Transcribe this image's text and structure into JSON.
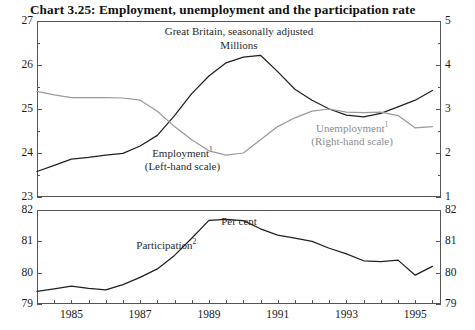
{
  "title": "Chart 3.25: Employment, unemployment and the participation rate",
  "chart_data": [
    {
      "type": "line",
      "title": "Great Britain, seasonally adjusted",
      "subtitle": "Millions",
      "xlabel": "",
      "ylabel": "Millions",
      "y2label": "Millions",
      "xlim": [
        1984.0,
        1995.75
      ],
      "ylim": [
        23,
        27
      ],
      "y2lim": [
        1,
        5
      ],
      "grid": false,
      "legend": "in-plot annotations",
      "yticks": [
        23,
        24,
        25,
        26,
        27
      ],
      "yticklabels": [
        "23",
        "24",
        "25",
        "26",
        "27"
      ],
      "yminorticks": [
        23.5,
        24.5,
        25.5,
        26.5
      ],
      "y2ticks": [
        1,
        2,
        3,
        4,
        5
      ],
      "y2ticklabels": [
        "1",
        "2",
        "3",
        "4",
        "5"
      ],
      "y2minorticks": [
        1.5,
        2.5,
        3.5,
        4.5
      ],
      "xticks": [
        1984.5,
        1985,
        1985.5,
        1986,
        1986.5,
        1987,
        1987.5,
        1988,
        1988.5,
        1989,
        1989.5,
        1990,
        1990.5,
        1991,
        1991.5,
        1992,
        1992.5,
        1993,
        1993.5,
        1994,
        1994.5,
        1995,
        1995.5
      ],
      "xticklabels": [
        "1985",
        "1987",
        "1989",
        "1991",
        "1993",
        "1995"
      ],
      "xticklabelvalues": [
        1985,
        1987,
        1989,
        1991,
        1993,
        1995
      ],
      "series": [
        {
          "name": "Employment",
          "axis": "left",
          "color": "#202020",
          "annotation": "Employment",
          "annotation_note": "1",
          "annotation_scale": "(Left-hand scale)",
          "x": [
            1984.0,
            1984.5,
            1985.0,
            1985.5,
            1986.0,
            1986.5,
            1987.0,
            1987.5,
            1988.0,
            1988.5,
            1989.0,
            1989.5,
            1990.0,
            1990.5,
            1991.0,
            1991.5,
            1992.0,
            1992.5,
            1993.0,
            1993.5,
            1994.0,
            1994.5,
            1995.0,
            1995.5
          ],
          "y": [
            23.58,
            23.72,
            23.86,
            23.9,
            23.95,
            23.99,
            24.16,
            24.4,
            24.85,
            25.35,
            25.75,
            26.05,
            26.18,
            26.22,
            25.85,
            25.45,
            25.2,
            25.0,
            24.86,
            24.82,
            24.9,
            25.05,
            25.2,
            25.42
          ]
        },
        {
          "name": "Unemployment",
          "axis": "right",
          "color": "#9a9a9a",
          "annotation": "Unemployment",
          "annotation_note": "1",
          "annotation_scale": "(Right-hand scale)",
          "x": [
            1984.0,
            1984.5,
            1985.0,
            1985.5,
            1986.0,
            1986.5,
            1987.0,
            1987.5,
            1988.0,
            1988.5,
            1989.0,
            1989.5,
            1990.0,
            1990.5,
            1991.0,
            1991.5,
            1992.0,
            1992.5,
            1993.0,
            1993.5,
            1994.0,
            1994.5,
            1995.0,
            1995.5
          ],
          "y": [
            3.4,
            3.32,
            3.26,
            3.26,
            3.26,
            3.25,
            3.2,
            2.95,
            2.6,
            2.3,
            2.05,
            1.95,
            2.0,
            2.3,
            2.6,
            2.8,
            2.95,
            3.0,
            2.93,
            2.92,
            2.93,
            2.85,
            2.57,
            2.6
          ]
        }
      ]
    },
    {
      "type": "line",
      "title": "Per cent",
      "subtitle": "",
      "xlabel": "",
      "ylabel": "Per cent",
      "xlim": [
        1984.0,
        1995.75
      ],
      "ylim": [
        79,
        82
      ],
      "grid": false,
      "yticks": [
        79,
        80,
        81,
        82
      ],
      "yticklabels": [
        "79",
        "80",
        "81",
        "82"
      ],
      "y2ticks": [
        79,
        80,
        81,
        82
      ],
      "y2ticklabels": [
        "79",
        "80",
        "81",
        "82"
      ],
      "xticks": [
        1984.5,
        1985,
        1985.5,
        1986,
        1986.5,
        1987,
        1987.5,
        1988,
        1988.5,
        1989,
        1989.5,
        1990,
        1990.5,
        1991,
        1991.5,
        1992,
        1992.5,
        1993,
        1993.5,
        1994,
        1994.5,
        1995,
        1995.5
      ],
      "xticklabels": [
        "1985",
        "1987",
        "1989",
        "1991",
        "1993",
        "1995"
      ],
      "xticklabelvalues": [
        1985,
        1987,
        1989,
        1991,
        1993,
        1995
      ],
      "series": [
        {
          "name": "Participation",
          "axis": "left",
          "color": "#202020",
          "annotation": "Participation",
          "annotation_note": "2",
          "x": [
            1984.0,
            1984.5,
            1985.0,
            1985.5,
            1986.0,
            1986.5,
            1987.0,
            1987.5,
            1988.0,
            1988.5,
            1989.0,
            1989.5,
            1990.0,
            1990.5,
            1991.0,
            1991.5,
            1992.0,
            1992.5,
            1993.0,
            1993.5,
            1994.0,
            1994.5,
            1995.0,
            1995.5
          ],
          "y": [
            79.4,
            79.48,
            79.57,
            79.5,
            79.45,
            79.62,
            79.85,
            80.12,
            80.55,
            81.1,
            81.67,
            81.7,
            81.66,
            81.4,
            81.2,
            81.1,
            81.0,
            80.78,
            80.6,
            80.38,
            80.35,
            80.4,
            79.92,
            80.2
          ]
        }
      ]
    }
  ],
  "panel_top": {
    "title": "Great Britain, seasonally adjusted",
    "subtitle": "Millions",
    "emp_label": "Employment",
    "emp_sup": "1",
    "emp_scale": "(Left-hand scale)",
    "unemp_label": "Unemployment",
    "unemp_sup": "1",
    "unemp_scale": "(Right-hand scale)"
  },
  "panel_bottom": {
    "units": "Per cent",
    "part_label": "Participation",
    "part_sup": "2"
  },
  "colors": {
    "employment": "#202020",
    "unemployment": "#9a9a9a",
    "participation": "#202020",
    "axis": "#555555",
    "text": "#1a1a1a"
  }
}
